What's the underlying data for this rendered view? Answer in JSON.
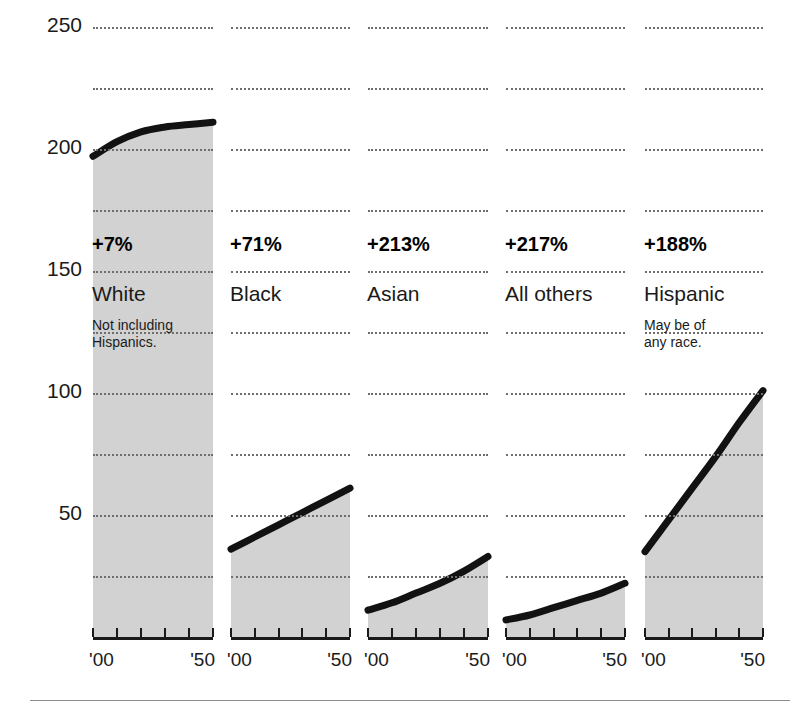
{
  "chart_data": {
    "type": "area",
    "title": "",
    "subtitle": "",
    "xlabel": "",
    "ylabel": "",
    "ylim": [
      0,
      250
    ],
    "xlim": [
      1900,
      1950
    ],
    "grid": true,
    "grid_interval": 25,
    "legend_position": "none",
    "y_ticks": [
      50,
      100,
      150,
      200,
      250
    ],
    "y_tick_labels": [
      "50",
      "100",
      "150",
      "200",
      "250"
    ],
    "x_tick_labels": [
      "'00",
      "'50"
    ],
    "x_ticks_per_panel": 6,
    "units": "millions",
    "panels": [
      {
        "name": "White",
        "note": "Not including\nHispanics.",
        "change_label": "+7%",
        "change_pct": 7,
        "x": [
          1900,
          1910,
          1920,
          1930,
          1940,
          1950
        ],
        "values": [
          197,
          203,
          207,
          209,
          210,
          211
        ]
      },
      {
        "name": "Black",
        "note": "",
        "change_label": "+71%",
        "change_pct": 71,
        "x": [
          1900,
          1910,
          1920,
          1930,
          1940,
          1950
        ],
        "values": [
          36,
          41,
          46,
          51,
          56,
          61
        ]
      },
      {
        "name": "Asian",
        "note": "",
        "change_label": "+213%",
        "change_pct": 213,
        "x": [
          1900,
          1910,
          1920,
          1930,
          1940,
          1950
        ],
        "values": [
          11,
          14,
          18,
          22,
          27,
          33
        ]
      },
      {
        "name": "All others",
        "note": "",
        "change_label": "+217%",
        "change_pct": 217,
        "x": [
          1900,
          1910,
          1920,
          1930,
          1940,
          1950
        ],
        "values": [
          7,
          9,
          12,
          15,
          18,
          22
        ]
      },
      {
        "name": "Hispanic",
        "note": "May be of\nany race.",
        "change_label": "+188%",
        "change_pct": 188,
        "x": [
          1900,
          1910,
          1920,
          1930,
          1940,
          1950
        ],
        "values": [
          35,
          48,
          61,
          74,
          88,
          101
        ]
      }
    ],
    "colors": {
      "fill": "#d2d2d2",
      "line": "#121212",
      "grid": "#6e6e6e",
      "axis": "#1a1a1a",
      "text": "#1a1a1a"
    }
  }
}
